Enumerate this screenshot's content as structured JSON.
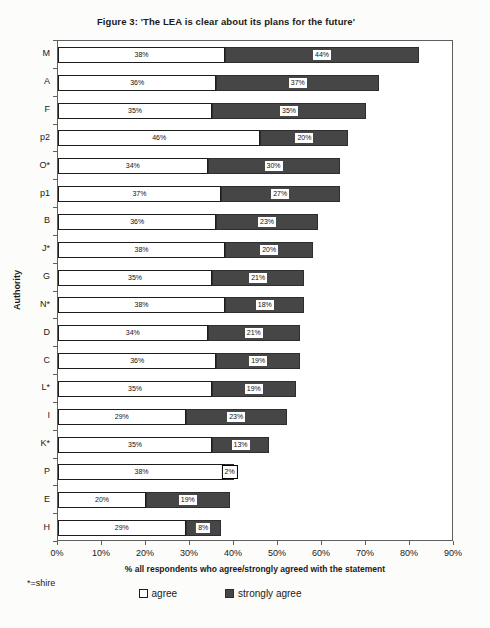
{
  "footnote": "*=shire",
  "colors": {
    "agree_fill": "#ffffff",
    "strongly_agree_fill": "#464646",
    "bar_border": "#1c1c1c",
    "plot_border": "#5f5f5f"
  },
  "chart_data": {
    "type": "bar",
    "orientation": "horizontal",
    "stacked": true,
    "title": "Figure 3: 'The LEA is clear about its plans for the future'",
    "ylabel": "Authority",
    "xlabel": "% all respondents who agree/strongly agreed with the statement",
    "xlim": [
      0,
      90
    ],
    "x_ticks": [
      "0%",
      "10%",
      "20%",
      "30%",
      "40%",
      "50%",
      "60%",
      "70%",
      "80%",
      "90%"
    ],
    "grid": false,
    "legend_position": "bottom",
    "categories": [
      "M",
      "A",
      "F",
      "p2",
      "O*",
      "p1",
      "B",
      "J*",
      "G",
      "N*",
      "D",
      "C",
      "L*",
      "I",
      "K*",
      "P",
      "E",
      "H"
    ],
    "series": [
      {
        "name": "agree",
        "values": [
          38,
          36,
          35,
          46,
          34,
          37,
          36,
          38,
          35,
          38,
          34,
          36,
          35,
          29,
          35,
          38,
          20,
          29
        ]
      },
      {
        "name": "strongly agree",
        "values": [
          44,
          37,
          35,
          20,
          30,
          27,
          23,
          20,
          21,
          18,
          21,
          19,
          19,
          23,
          13,
          2,
          19,
          8
        ]
      }
    ],
    "data_label_format": "{v}%",
    "legend": [
      {
        "label": "agree",
        "swatch": "outline"
      },
      {
        "label": "strongly agree",
        "swatch": "filled"
      }
    ]
  }
}
